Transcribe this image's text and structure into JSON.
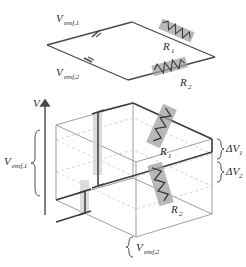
{
  "figure": {
    "colors": {
      "wire": "#4a4a4a",
      "wire_dark": "#3c3c3c",
      "resistor_body": "#9a9a9a",
      "resistor_zigzag": "#3a3a3a",
      "box_edge": "#8d8d8d",
      "grid_dashed": "#c9c9c9",
      "emf_bar": "#d2d2d2",
      "axis": "#555555",
      "text": "#2a2a2a"
    }
  },
  "top_circuit": {
    "name": "circuit-diagram",
    "emf1": {
      "label": "V",
      "sub": "emf,1"
    },
    "emf2": {
      "label": "V",
      "sub": "emf,2"
    },
    "r1": {
      "label": "R",
      "sub": "1"
    },
    "r2": {
      "label": "R",
      "sub": "2"
    }
  },
  "potential_diagram": {
    "name": "potential-3d-diagram",
    "axis": {
      "label": "V"
    },
    "emf1": {
      "label": "V",
      "sub": "emf,1"
    },
    "emf2": {
      "label": "V",
      "sub": "emf,2"
    },
    "r1": {
      "label": "R",
      "sub": "1"
    },
    "r2": {
      "label": "R",
      "sub": "2"
    },
    "dv1": {
      "label": "ΔV",
      "sub": "1"
    },
    "dv2": {
      "label": "ΔV",
      "sub": "2"
    },
    "brace_left": "{",
    "brace_right_1": "{",
    "brace_right_2": "{",
    "brace_bottom": "{"
  }
}
